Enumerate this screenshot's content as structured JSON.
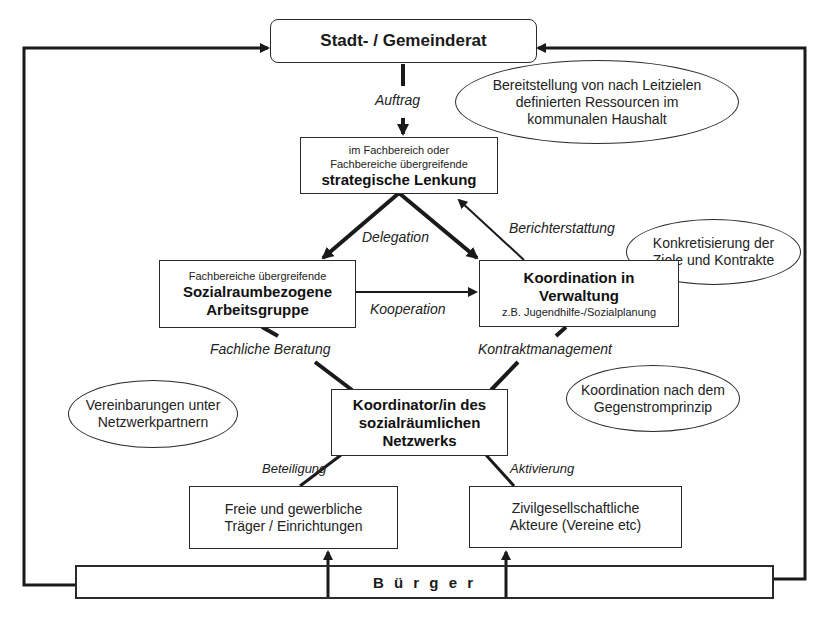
{
  "diagram": {
    "colors": {
      "stroke": "#1a1a1a",
      "background": "#ffffff",
      "text": "#222222"
    },
    "nodes": {
      "council": {
        "title": "Stadt- / Gemeinderat"
      },
      "strategic": {
        "line1": "im Fachbereich oder",
        "line2": "Fachbereiche übergreifende",
        "title": "strategische Lenkung"
      },
      "workgroup": {
        "subtitle": "Fachbereiche übergreifende",
        "title1": "Sozialraumbezogene",
        "title2": "Arbeitsgruppe"
      },
      "admin": {
        "title1": "Koordination in",
        "title2": "Verwaltung",
        "subtitle": "z.B. Jugendhilfe-/Sozialplanung"
      },
      "coordinator": {
        "line1": "Koordinator/in des",
        "line2": "sozialräumlichen",
        "line3": "Netzwerks"
      },
      "providers": {
        "line1": "Freie und gewerbliche",
        "line2": "Träger / Einrichtungen"
      },
      "civil": {
        "line1": "Zivilgesellschaftliche",
        "line2": "Akteure (Vereine etc)"
      },
      "citizens": {
        "title": "B ü r g e r"
      }
    },
    "ellipses": {
      "resources": {
        "line1": "Bereitstellung von nach Leitzielen",
        "line2": "definierten Ressourcen im",
        "line3": "kommunalen Haushalt"
      },
      "contracts": {
        "line1": "Konkretisierung der",
        "line2": "Ziele und Kontrakte"
      },
      "agreements": {
        "line1": "Vereinbarungen unter",
        "line2": "Netzwerkpartnern"
      },
      "countercurrent": {
        "line1": "Koordination nach dem",
        "line2": "Gegenstromprinzip"
      }
    },
    "edge_labels": {
      "auftrag": "Auftrag",
      "delegation": "Delegation",
      "berichterstattung": "Berichterstattung",
      "kooperation": "Kooperation",
      "fachliche_beratung": "Fachliche Beratung",
      "kontraktmanagement": "Kontraktmanagement",
      "beteiligung": "Beteiligung",
      "aktivierung": "Aktivierung"
    }
  }
}
